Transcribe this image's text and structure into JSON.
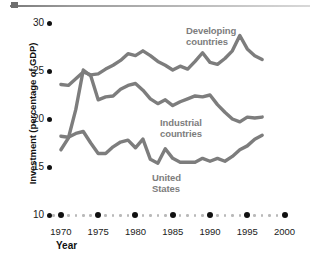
{
  "chart_data": {
    "type": "line",
    "title": "",
    "xlabel": "Year",
    "ylabel": "Investment (percentage of GDP)",
    "xlim": [
      1968,
      2001
    ],
    "ylim": [
      10,
      30
    ],
    "grid": false,
    "legend_position": "inline-annotations",
    "x_ticks": [
      1970,
      1975,
      1980,
      1985,
      1990,
      1995,
      2000
    ],
    "x_tick_labels": [
      "1970",
      "1975",
      "1980",
      "1985",
      "1990",
      "1995",
      "2000"
    ],
    "y_ticks": [
      10,
      15,
      20,
      25,
      30
    ],
    "y_tick_labels": [
      "10",
      "15",
      "20",
      "25",
      "30"
    ],
    "series": [
      {
        "name": "Developing countries",
        "color": "#7d7d7d",
        "x": [
          1970,
          1971,
          1972,
          1973,
          1974,
          1975,
          1976,
          1977,
          1978,
          1979,
          1980,
          1981,
          1982,
          1983,
          1984,
          1985,
          1986,
          1987,
          1988,
          1989,
          1990,
          1991,
          1992,
          1993,
          1994,
          1995,
          1996,
          1997
        ],
        "values": [
          23.6,
          23.5,
          24.2,
          24.9,
          24.6,
          24.7,
          25.2,
          25.6,
          26.1,
          26.8,
          26.6,
          27.1,
          26.6,
          26.0,
          25.6,
          25.1,
          25.5,
          25.2,
          26.0,
          26.9,
          25.9,
          25.7,
          26.3,
          27.1,
          28.7,
          27.3,
          26.6,
          26.2
        ]
      },
      {
        "name": "Industrial countries",
        "color": "#7d7d7d",
        "x": [
          1970,
          1971,
          1972,
          1973,
          1974,
          1975,
          1976,
          1977,
          1978,
          1979,
          1980,
          1981,
          1982,
          1983,
          1984,
          1985,
          1986,
          1987,
          1988,
          1989,
          1990,
          1991,
          1992,
          1993,
          1994,
          1995,
          1996,
          1997
        ],
        "values": [
          16.8,
          18.0,
          21.0,
          25.1,
          24.5,
          22.0,
          22.3,
          22.4,
          23.1,
          23.5,
          23.7,
          23.0,
          22.1,
          21.6,
          22.0,
          21.4,
          21.8,
          22.1,
          22.4,
          22.3,
          22.5,
          21.5,
          20.7,
          20.0,
          19.7,
          20.2,
          20.1,
          20.2
        ]
      },
      {
        "name": "United States",
        "color": "#7d7d7d",
        "x": [
          1970,
          1971,
          1972,
          1973,
          1974,
          1975,
          1976,
          1977,
          1978,
          1979,
          1980,
          1981,
          1982,
          1983,
          1984,
          1985,
          1986,
          1987,
          1988,
          1989,
          1990,
          1991,
          1992,
          1993,
          1994,
          1995,
          1996,
          1997
        ],
        "values": [
          18.2,
          18.1,
          18.5,
          18.7,
          17.5,
          16.4,
          16.4,
          17.1,
          17.6,
          17.8,
          17.0,
          17.9,
          15.8,
          15.4,
          16.9,
          15.9,
          15.5,
          15.5,
          15.5,
          15.9,
          15.6,
          15.9,
          15.6,
          16.1,
          16.8,
          17.2,
          17.9,
          18.3
        ]
      }
    ],
    "annotations": [
      {
        "name": "developing-countries-label",
        "text_line1": "Developing",
        "text_line2": "countries"
      },
      {
        "name": "industrial-countries-label",
        "text_line1": "Industrial",
        "text_line2": "countries"
      },
      {
        "name": "united-states-label",
        "text_line1": "United",
        "text_line2": "States"
      }
    ],
    "colors": {
      "line": "#7d7d7d",
      "axis_dot": "#111111",
      "minor_dot": "#b9b9b9",
      "text": "#1a1a1a",
      "background": "#ffffff"
    }
  }
}
